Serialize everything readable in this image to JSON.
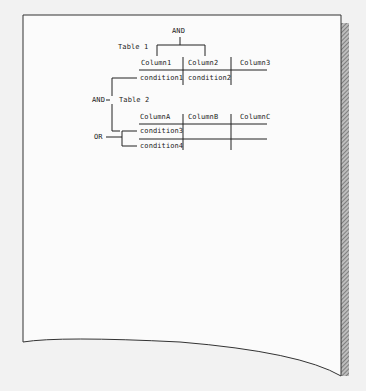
{
  "diagram": {
    "top_operator": "AND",
    "table1": {
      "title": "Table 1",
      "columns": [
        "Column1",
        "Column2",
        "Column3"
      ],
      "conditions": [
        "condition1",
        "condition2",
        ""
      ]
    },
    "left_operator": "AND",
    "table2": {
      "title": "Table 2",
      "columns": [
        "ColumnA",
        "ColumnB",
        "ColumnC"
      ],
      "conditions": [
        "condition3",
        "condition4"
      ]
    },
    "or_operator": "OR"
  }
}
